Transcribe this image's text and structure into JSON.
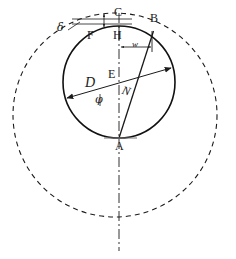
{
  "figure": {
    "kind": "geometric-diagram",
    "width": 236,
    "height": 259,
    "background_color": "#ffffff",
    "stroke_color": "#1a1a1a"
  },
  "labels": {
    "point_c": "C",
    "point_b": "B",
    "point_f": "F",
    "point_h": "H",
    "point_e": "E",
    "point_a": "A",
    "diameter_d": "D",
    "offset_w": "w",
    "delta": "δ",
    "phi": "φ",
    "nu": "N"
  },
  "geometry": {
    "solid_circle": {
      "cx": 119,
      "cy": 82,
      "r": 56
    },
    "dashed_circle": {
      "cx": 115,
      "cy": 115,
      "r": 102
    },
    "center_point_e": {
      "x": 119,
      "y": 82
    },
    "point_c": {
      "x": 119,
      "y": 26
    },
    "point_b": {
      "x": 154,
      "y": 32
    },
    "point_h": {
      "x": 119,
      "y": 36
    },
    "point_a": {
      "x": 119,
      "y": 138
    },
    "point_f": {
      "x": 90,
      "y": 34
    },
    "diameter_line": {
      "x1": 66,
      "y1": 98,
      "x2": 172,
      "y2": 68
    },
    "chord_ab": {
      "x1": 119,
      "y1": 138,
      "x2": 154,
      "y2": 32
    },
    "vertical_axis": {
      "x": 119,
      "y1": 14,
      "y2": 250
    },
    "w_dimension": {
      "x1": 124,
      "x2": 152,
      "y": 47
    },
    "delta_dimension": {
      "x1": 72,
      "x2": 119,
      "y": 20
    }
  },
  "strokes": {
    "solid_width": 1.5,
    "thin_width": 0.9,
    "dash_pattern": "5 4",
    "axis_dash_pattern": "9 3 2 3"
  }
}
